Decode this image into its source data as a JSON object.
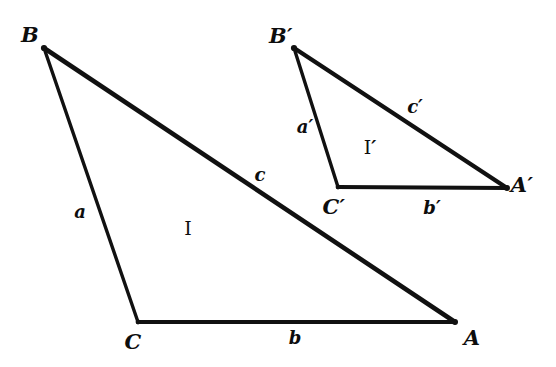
{
  "figure": {
    "background_color": "#ffffff",
    "stroke_color": "#111111",
    "text_color": "#0d0d0d"
  },
  "triangles": [
    {
      "name": "triangle-I",
      "region_label": "I",
      "region_label_pos": {
        "x": 188,
        "y": 228
      },
      "vertices": [
        {
          "name": "B",
          "label": "B",
          "x": 44,
          "y": 48,
          "label_x": 30,
          "label_y": 34
        },
        {
          "name": "C",
          "label": "C",
          "x": 138,
          "y": 322,
          "label_x": 133,
          "label_y": 341
        },
        {
          "name": "A",
          "label": "A",
          "x": 455,
          "y": 322,
          "label_x": 472,
          "label_y": 337
        }
      ],
      "sides": [
        {
          "name": "a",
          "label": "a",
          "from": "B",
          "to": "C",
          "label_x": 80,
          "label_y": 212
        },
        {
          "name": "b",
          "label": "b",
          "from": "C",
          "to": "A",
          "label_x": 295,
          "label_y": 338
        },
        {
          "name": "c",
          "label": "c",
          "from": "B",
          "to": "A",
          "label_x": 260,
          "label_y": 175
        }
      ]
    },
    {
      "name": "triangle-I-prime",
      "region_label": "I",
      "region_label_prime": "′",
      "region_label_pos": {
        "x": 370,
        "y": 147
      },
      "vertices": [
        {
          "name": "B-prime",
          "label": "B",
          "prime": "′",
          "x": 294,
          "y": 48,
          "label_x": 281,
          "label_y": 35
        },
        {
          "name": "C-prime",
          "label": "C",
          "prime": "′",
          "x": 338,
          "y": 187,
          "label_x": 334,
          "label_y": 206
        },
        {
          "name": "A-prime",
          "label": "A",
          "prime": "′",
          "x": 507,
          "y": 188,
          "label_x": 522,
          "label_y": 184
        }
      ],
      "sides": [
        {
          "name": "a-prime",
          "label": "a",
          "prime": "′",
          "from": "B-prime",
          "to": "C-prime",
          "label_x": 305,
          "label_y": 127
        },
        {
          "name": "b-prime",
          "label": "b",
          "prime": "′",
          "from": "C-prime",
          "to": "A-prime",
          "label_x": 432,
          "label_y": 208
        },
        {
          "name": "c-prime",
          "label": "c",
          "prime": "′",
          "from": "B-prime",
          "to": "A-prime",
          "label_x": 415,
          "label_y": 107
        }
      ]
    }
  ]
}
